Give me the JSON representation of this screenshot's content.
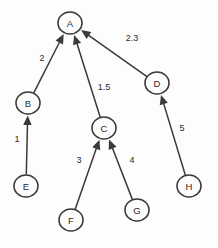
{
  "diagram": {
    "type": "directed-weighted-graph",
    "background_color": "#fdfdfd",
    "stroke_color": "#3a3a3a",
    "text_color": "#2b2b2b",
    "nodes": [
      {
        "id": "A",
        "label": "A",
        "cx": 70,
        "cy": 23,
        "rx": 12,
        "ry": 11
      },
      {
        "id": "B",
        "label": "B",
        "cx": 28,
        "cy": 103,
        "rx": 12,
        "ry": 11
      },
      {
        "id": "C",
        "label": "C",
        "cx": 104,
        "cy": 128,
        "rx": 12,
        "ry": 11
      },
      {
        "id": "D",
        "label": "D",
        "cx": 157,
        "cy": 83,
        "rx": 12,
        "ry": 11
      },
      {
        "id": "E",
        "label": "E",
        "cx": 26,
        "cy": 186,
        "rx": 12,
        "ry": 11
      },
      {
        "id": "F",
        "label": "F",
        "cx": 71,
        "cy": 220,
        "rx": 12,
        "ry": 11
      },
      {
        "id": "G",
        "label": "G",
        "cx": 137,
        "cy": 210,
        "rx": 12,
        "ry": 11
      },
      {
        "id": "H",
        "label": "H",
        "cx": 189,
        "cy": 186,
        "rx": 12,
        "ry": 11
      }
    ],
    "edges": [
      {
        "id": "B-A",
        "from": "B",
        "to": "A",
        "weight": "2",
        "label_x": 42,
        "label_y": 58
      },
      {
        "id": "C-A",
        "from": "C",
        "to": "A",
        "weight": "1.5",
        "label_x": 104,
        "label_y": 87
      },
      {
        "id": "D-A",
        "from": "D",
        "to": "A",
        "weight": "2.3",
        "label_x": 132,
        "label_y": 38
      },
      {
        "id": "E-B",
        "from": "E",
        "to": "B",
        "weight": "1",
        "label_x": 17,
        "label_y": 139
      },
      {
        "id": "F-C",
        "from": "F",
        "to": "C",
        "weight": "3",
        "label_x": 79,
        "label_y": 160
      },
      {
        "id": "G-C",
        "from": "G",
        "to": "C",
        "weight": "4",
        "label_x": 132,
        "label_y": 160
      },
      {
        "id": "H-D",
        "from": "H",
        "to": "D",
        "weight": "5",
        "label_x": 182,
        "label_y": 128
      }
    ]
  }
}
